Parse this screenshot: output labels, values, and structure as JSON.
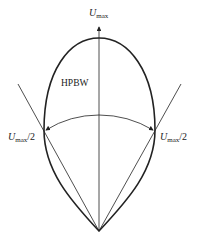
{
  "diagram": {
    "labels": {
      "top_symbol": "U",
      "top_sub": "max",
      "left_symbol": "U",
      "left_sub": "max",
      "left_suffix": "/2",
      "right_symbol": "U",
      "right_sub": "max",
      "right_suffix": "/2",
      "hpbw": "HPBW"
    },
    "colors": {
      "stroke": "#222222",
      "background": "#ffffff"
    }
  }
}
